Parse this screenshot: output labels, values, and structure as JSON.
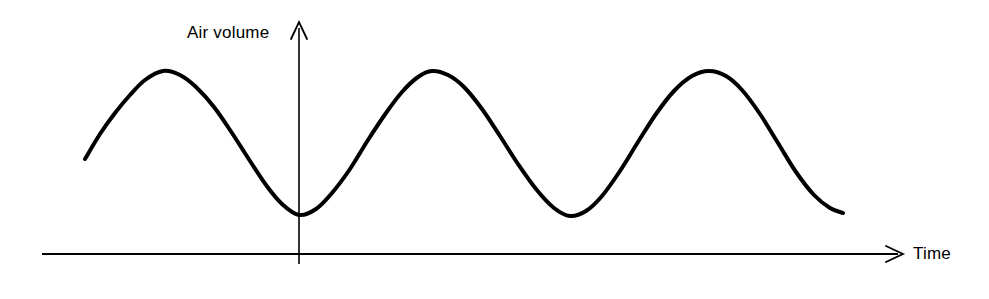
{
  "figure": {
    "background_color": "#ffffff",
    "ink_color": "#000000"
  },
  "axes": {
    "y_axis": {
      "label": "Air volume",
      "icon": "arrow-up-icon",
      "x_px": 299,
      "top_px": 22,
      "bottom_px": 264,
      "stroke_width": 1.6
    },
    "x_axis": {
      "label": "Time",
      "icon": "arrow-right-icon",
      "y_px": 254,
      "left_px": 42,
      "right_px": 903,
      "stroke_width": 1.6
    }
  },
  "chart_data": {
    "type": "line",
    "title": "",
    "xlabel": "Time",
    "ylabel": "Air volume",
    "grid": false,
    "legend": null,
    "series": [
      {
        "name": "Air volume",
        "description": "Smooth periodic breathing waveform: three crests and three troughs of equal amplitude",
        "stroke_color": "#000000",
        "stroke_width": 4,
        "waveform": "sinusoid",
        "period_px": 275,
        "peak_y_px": 71,
        "trough_y_px": 215,
        "amplitude_px": 72,
        "midline_y_px": 143,
        "start_point": {
          "x": 85,
          "y": 159
        },
        "end_point": {
          "x": 843,
          "y": 213
        },
        "peaks": [
          {
            "x": 163,
            "y": 71
          },
          {
            "x": 432,
            "y": 71
          },
          {
            "x": 709,
            "y": 71
          }
        ],
        "troughs": [
          {
            "x": 299,
            "y": 215
          },
          {
            "x": 570,
            "y": 216
          }
        ],
        "points": [
          {
            "x": 85,
            "y": 159
          },
          {
            "x": 100,
            "y": 134
          },
          {
            "x": 115,
            "y": 113
          },
          {
            "x": 130,
            "y": 95
          },
          {
            "x": 145,
            "y": 80
          },
          {
            "x": 163,
            "y": 71
          },
          {
            "x": 180,
            "y": 75
          },
          {
            "x": 196,
            "y": 87
          },
          {
            "x": 214,
            "y": 107
          },
          {
            "x": 232,
            "y": 133
          },
          {
            "x": 250,
            "y": 161
          },
          {
            "x": 266,
            "y": 185
          },
          {
            "x": 282,
            "y": 204
          },
          {
            "x": 299,
            "y": 215
          },
          {
            "x": 316,
            "y": 209
          },
          {
            "x": 332,
            "y": 193
          },
          {
            "x": 350,
            "y": 169
          },
          {
            "x": 368,
            "y": 140
          },
          {
            "x": 386,
            "y": 113
          },
          {
            "x": 402,
            "y": 92
          },
          {
            "x": 418,
            "y": 77
          },
          {
            "x": 432,
            "y": 71
          },
          {
            "x": 448,
            "y": 75
          },
          {
            "x": 464,
            "y": 87
          },
          {
            "x": 482,
            "y": 109
          },
          {
            "x": 500,
            "y": 136
          },
          {
            "x": 518,
            "y": 164
          },
          {
            "x": 536,
            "y": 189
          },
          {
            "x": 554,
            "y": 208
          },
          {
            "x": 570,
            "y": 216
          },
          {
            "x": 586,
            "y": 211
          },
          {
            "x": 602,
            "y": 196
          },
          {
            "x": 620,
            "y": 171
          },
          {
            "x": 638,
            "y": 142
          },
          {
            "x": 656,
            "y": 114
          },
          {
            "x": 674,
            "y": 91
          },
          {
            "x": 692,
            "y": 76
          },
          {
            "x": 709,
            "y": 71
          },
          {
            "x": 726,
            "y": 76
          },
          {
            "x": 742,
            "y": 90
          },
          {
            "x": 760,
            "y": 114
          },
          {
            "x": 778,
            "y": 143
          },
          {
            "x": 796,
            "y": 172
          },
          {
            "x": 814,
            "y": 195
          },
          {
            "x": 830,
            "y": 208
          },
          {
            "x": 843,
            "y": 213
          }
        ]
      }
    ]
  }
}
